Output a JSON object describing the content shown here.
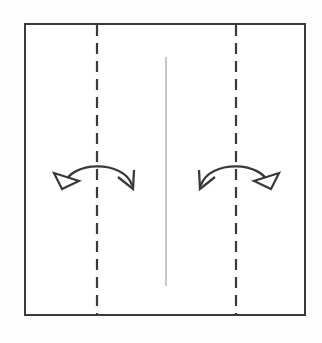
{
  "figure": {
    "kind": "origami-fold-diagram",
    "title": "Origami step: fold both side panels in to the center crease and unfold",
    "canvas": {
      "width": 322,
      "height": 343,
      "background": "#fdfdfd"
    },
    "colors": {
      "paper_outline": "#3a3a3a",
      "paper_fill": "#ffffff",
      "crease_dashed": "#3a3a3a",
      "crease_existing": "#9a9a9a",
      "arrow": "#3a3a3a",
      "arrowhead_hollow_fill": "#ffffff"
    },
    "paper": {
      "name": "square sheet",
      "shape": "square",
      "x": 25,
      "y": 24,
      "width": 280,
      "height": 291,
      "stroke_width": 2.2
    },
    "crease_lines": [
      {
        "id": "left-fold-crease",
        "label": "left vertical fold line",
        "style": "dashed",
        "orientation": "vertical",
        "x": 97,
        "y_start": 25,
        "y_end": 314,
        "stroke_width": 2.2,
        "dash": "11 7"
      },
      {
        "id": "right-fold-crease",
        "label": "right vertical fold line",
        "style": "dashed",
        "orientation": "vertical",
        "x": 236,
        "y_start": 25,
        "y_end": 314,
        "stroke_width": 2.2,
        "dash": "11 7"
      },
      {
        "id": "center-existing-crease",
        "label": "center vertical existing crease",
        "style": "solid-thin",
        "orientation": "vertical",
        "x": 166,
        "y_start": 57,
        "y_end": 286,
        "stroke_width": 1.1
      }
    ],
    "arrows": [
      {
        "id": "left-fold-unfold-arrow",
        "label": "fold and unfold arrow over left crease",
        "arc_path": "M 63 186 C 70 160 124 160 132 185",
        "stroke_width": 2.3,
        "start_head": {
          "type": "hollow-triangle",
          "label": "unfold arrowhead (hollow triangle)",
          "points": "63 188 55 174 78 182",
          "filled": false
        },
        "end_head": {
          "type": "v-barb",
          "label": "fold arrowhead (open V barb)",
          "path": "M 119 178 L 133 188 L 133 171",
          "filled": false
        }
      },
      {
        "id": "right-fold-unfold-arrow",
        "label": "fold and unfold arrow over right crease",
        "arc_path": "M 270 186 C 263 160 209 160 201 185",
        "stroke_width": 2.3,
        "start_head": {
          "type": "hollow-triangle",
          "label": "unfold arrowhead (hollow triangle)",
          "points": "270 188 278 174 255 182",
          "filled": false
        },
        "end_head": {
          "type": "v-barb",
          "label": "fold arrowhead (open V barb)",
          "path": "M 214 178 L 200 188 L 200 171",
          "filled": false
        }
      }
    ],
    "caption": ""
  }
}
